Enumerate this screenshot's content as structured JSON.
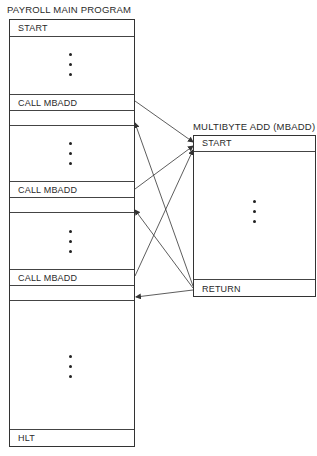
{
  "main_program": {
    "title": "PAYROLL MAIN PROGRAM",
    "rows": {
      "start": "START",
      "call1": "CALL MBADD",
      "call2": "CALL MBADD",
      "call3": "CALL MBADD",
      "halt": "HLT"
    }
  },
  "subroutine": {
    "title": "MULTIBYTE ADD (MBADD)",
    "rows": {
      "start": "START",
      "return": "RETURN"
    }
  },
  "arrows": [
    {
      "from": "call1",
      "to": "subroutine.start"
    },
    {
      "from": "call2",
      "to": "subroutine.start"
    },
    {
      "from": "call3",
      "to": "subroutine.start"
    },
    {
      "from": "subroutine.return",
      "to": "return-after-call1"
    },
    {
      "from": "subroutine.return",
      "to": "return-after-call2"
    },
    {
      "from": "subroutine.return",
      "to": "return-after-call3"
    }
  ],
  "colors": {
    "line": "#333333",
    "background": "#ffffff"
  }
}
